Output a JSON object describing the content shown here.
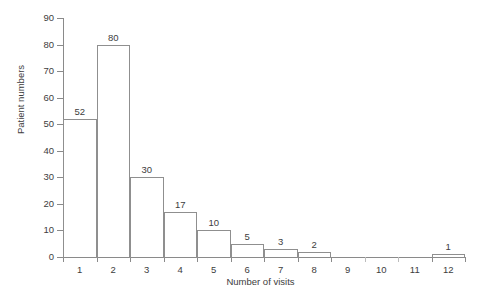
{
  "chart_data": {
    "type": "bar",
    "title": "",
    "subtitle": "",
    "xlabel": "Number of visits",
    "ylabel": "Patient numbers",
    "categories": [
      "1",
      "2",
      "3",
      "4",
      "5",
      "6",
      "7",
      "8",
      "9",
      "10",
      "11",
      "12"
    ],
    "values": [
      52,
      80,
      30,
      17,
      10,
      5,
      3,
      2,
      0,
      0,
      0,
      1
    ],
    "data_labels": [
      "52",
      "80",
      "30",
      "17",
      "10",
      "5",
      "3",
      "2",
      "",
      "",
      "",
      "1"
    ],
    "ylim": [
      0,
      90
    ],
    "ytick_labels": [
      "0",
      "10",
      "20",
      "30",
      "40",
      "50",
      "60",
      "70",
      "80",
      "90"
    ],
    "ytick_values": [
      0,
      10,
      20,
      30,
      40,
      50,
      60,
      70,
      80,
      90
    ],
    "ytick_step": 10,
    "xlim_categories": [
      1,
      12
    ],
    "grid": false,
    "legend": false,
    "legend_position": "none",
    "annotations": [],
    "colors": {
      "background": "#ffffff",
      "bar_outline": "#8f8f8f",
      "bar_fill": "transparent",
      "axis": "#8a8a8a",
      "text": "#3d3d3d"
    }
  }
}
